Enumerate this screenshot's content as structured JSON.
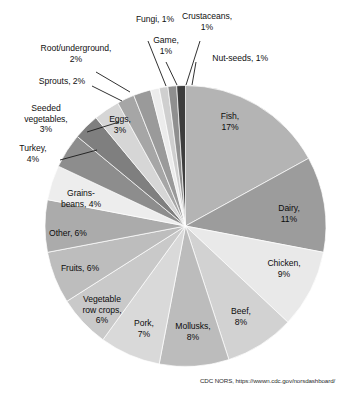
{
  "chart_data": {
    "type": "pie",
    "title": "",
    "subtitle": "",
    "xlabel": "",
    "ylabel": "",
    "legend_position": "none",
    "grid": false,
    "labels_format": "name, percent",
    "start_angle_deg": 0,
    "direction": "clockwise",
    "categories": [
      "Fish",
      "Dairy",
      "Chicken",
      "Beef",
      "Mollusks",
      "Pork",
      "Vegetable row crops",
      "Fruits",
      "Other",
      "Grains-beans",
      "Turkey",
      "Seeded vegetables",
      "Eggs",
      "Sprouts",
      "Root/underground",
      "Fungi",
      "Game",
      "Crustaceans",
      "Nut-seeds"
    ],
    "values": [
      17,
      11,
      9,
      8,
      8,
      7,
      6,
      6,
      6,
      4,
      4,
      3,
      3,
      2,
      2,
      1,
      1,
      1,
      1
    ],
    "units": "percent",
    "colors": [
      "#b4b4b4",
      "#9c9c9c",
      "#e9e9e9",
      "#d2d2d2",
      "#bcbcbc",
      "#d9d9d9",
      "#c9c9c9",
      "#bdbdbd",
      "#ababab",
      "#ededed",
      "#8d8d8d",
      "#7f7f7f",
      "#d6d6d6",
      "#a6a6a6",
      "#9a9a9a",
      "#ececec",
      "#cfcfcf",
      "#8f8f8f",
      "#3d3d3d"
    ],
    "slice_labels": [
      {
        "name": "Fish",
        "text": "Fish,\n17%",
        "percent": 17,
        "placement": "inside"
      },
      {
        "name": "Dairy",
        "text": "Dairy,\n11%",
        "percent": 11,
        "placement": "inside"
      },
      {
        "name": "Chicken",
        "text": "Chicken,\n9%",
        "percent": 9,
        "placement": "inside"
      },
      {
        "name": "Beef",
        "text": "Beef,\n8%",
        "percent": 8,
        "placement": "inside"
      },
      {
        "name": "Mollusks",
        "text": "Mollusks,\n8%",
        "percent": 8,
        "placement": "inside"
      },
      {
        "name": "Pork",
        "text": "Pork,\n7%",
        "percent": 7,
        "placement": "inside"
      },
      {
        "name": "Vegetable row crops",
        "text": "Vegetable\nrow crops,\n6%",
        "percent": 6,
        "placement": "inside"
      },
      {
        "name": "Fruits",
        "text": "Fruits, 6%",
        "percent": 6,
        "placement": "inside"
      },
      {
        "name": "Other",
        "text": "Other, 6%",
        "percent": 6,
        "placement": "inside"
      },
      {
        "name": "Grains-beans",
        "text": "Grains-\nbeans, 4%",
        "percent": 4,
        "placement": "inside"
      },
      {
        "name": "Turkey",
        "text": "Turkey,\n4%",
        "percent": 4,
        "placement": "outside"
      },
      {
        "name": "Seeded vegetables",
        "text": "Seeded\nvegetables,\n3%",
        "percent": 3,
        "placement": "outside"
      },
      {
        "name": "Eggs",
        "text": "Eggs,\n3%",
        "percent": 3,
        "placement": "inside"
      },
      {
        "name": "Sprouts",
        "text": "Sprouts, 2%",
        "percent": 2,
        "placement": "outside"
      },
      {
        "name": "Root/underground",
        "text": "Root/underground,\n2%",
        "percent": 2,
        "placement": "outside"
      },
      {
        "name": "Fungi",
        "text": "Fungi, 1%",
        "percent": 1,
        "placement": "outside"
      },
      {
        "name": "Game",
        "text": "Game,\n1%",
        "percent": 1,
        "placement": "outside"
      },
      {
        "name": "Crustaceans",
        "text": "Crustaceans,\n1%",
        "percent": 1,
        "placement": "outside"
      },
      {
        "name": "Nut-seeds",
        "text": "Nut-seeds, 1%",
        "percent": 1,
        "placement": "outside"
      }
    ]
  },
  "source": {
    "text": "CDC NORS, https://wwwn.cdc.gov/norsdashboard/"
  }
}
